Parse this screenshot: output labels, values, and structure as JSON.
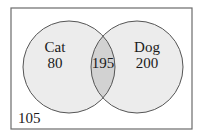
{
  "diagram": {
    "type": "venn",
    "universe_count": "105",
    "sets": [
      {
        "name": "Cat",
        "only_count": "80"
      },
      {
        "name": "Dog",
        "only_count": "200"
      }
    ],
    "intersection_count": "195",
    "colors": {
      "border": "#6b6b6b",
      "circle_fill": "#ececec",
      "intersection_fill": "#d2d2d2",
      "circle_stroke": "#555555",
      "text": "#1a1a1a"
    }
  }
}
